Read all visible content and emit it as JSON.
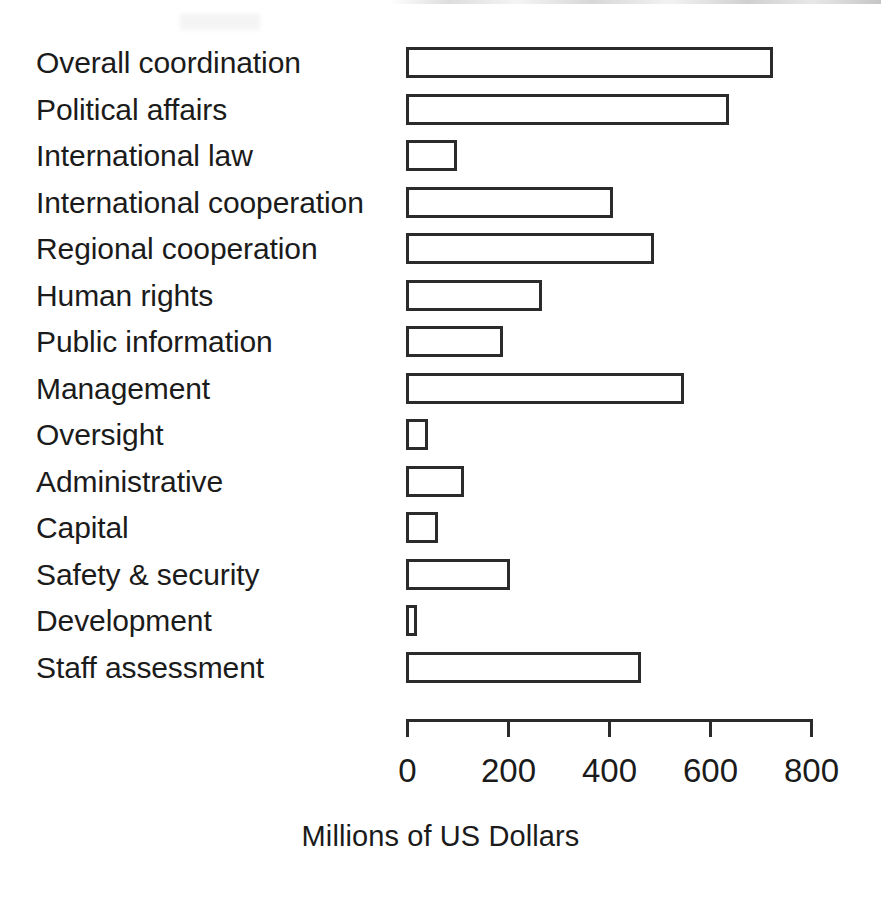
{
  "chart_data": {
    "type": "bar",
    "orientation": "horizontal",
    "title": "",
    "subtitle": "",
    "xlabel": "Millions of US Dollars",
    "ylabel": "",
    "xlim": [
      0,
      800
    ],
    "xticks": [
      0,
      200,
      400,
      600,
      800
    ],
    "xtick_labels": [
      "0",
      "200",
      "400",
      "600",
      "800"
    ],
    "grid": false,
    "legend": false,
    "legend_position": "none",
    "bar_fill_color": "#ffffff",
    "bar_edge_color": "#2b2b2b",
    "text_color": "#1b1b1b",
    "background_color": "#ffffff",
    "categories": [
      "Overall coordination",
      "Political affairs",
      "International law",
      "International cooperation",
      "Regional cooperation",
      "Human rights",
      "Public information",
      "Management",
      "Oversight",
      "Administrative",
      "Capital",
      "Safety & security",
      "Development",
      "Staff assessment"
    ],
    "values": [
      727,
      640,
      100,
      410,
      492,
      270,
      193,
      551,
      44,
      115,
      63,
      205,
      22,
      466
    ],
    "units": "Millions of US Dollars"
  },
  "axis": {
    "title": "Millions of US Dollars"
  }
}
